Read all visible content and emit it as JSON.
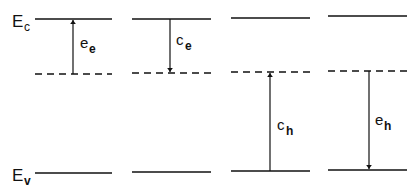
{
  "diagram": {
    "type": "energy-band transitions",
    "colors": {
      "line": "#111111",
      "background": "#ffffff"
    },
    "band_labels": {
      "conduction": {
        "main": "E",
        "sub": "c"
      },
      "valence": {
        "main": "E",
        "sub": "v"
      }
    },
    "panels": [
      {
        "id": 1,
        "transition": {
          "main": "e",
          "sub": "e"
        },
        "direction": "up",
        "from": "trap",
        "to": "Ec"
      },
      {
        "id": 2,
        "transition": {
          "main": "c",
          "sub": "e"
        },
        "direction": "down",
        "from": "Ec",
        "to": "trap"
      },
      {
        "id": 3,
        "transition": {
          "main": "c",
          "sub": "h"
        },
        "direction": "up",
        "from": "Ev",
        "to": "trap"
      },
      {
        "id": 4,
        "transition": {
          "main": "e",
          "sub": "h"
        },
        "direction": "down",
        "from": "trap",
        "to": "Ev"
      }
    ]
  }
}
